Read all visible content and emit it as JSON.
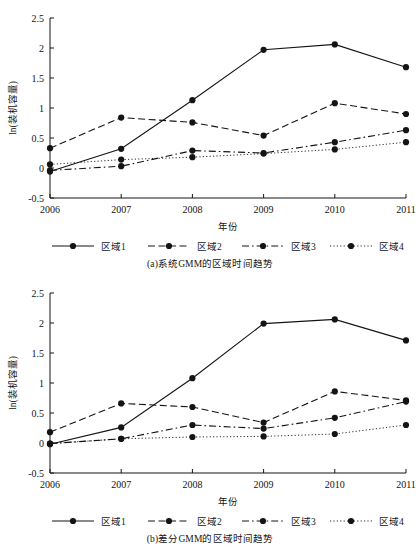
{
  "figure": {
    "panels": [
      {
        "id": "panel-a",
        "caption": "(a)系统GMM的区域时间趋势",
        "chart_data": {
          "type": "line",
          "title": "",
          "xlabel": "年份",
          "ylabel": "ln(装机容量)",
          "categories": [
            "2006",
            "2007",
            "2008",
            "2009",
            "2010",
            "2011"
          ],
          "x": [
            2006,
            2007,
            2008,
            2009,
            2010,
            2011
          ],
          "xlim": [
            2006,
            2011
          ],
          "ylim": [
            -0.5,
            2.5
          ],
          "yticks": [
            -0.5,
            0,
            0.5,
            1,
            1.5,
            2,
            2.5
          ],
          "yticklabels": [
            "-0.5",
            "0",
            "0.5",
            "1",
            "1.5",
            "2",
            "2.5"
          ],
          "grid": false,
          "legend_position": "below-axes",
          "series": [
            {
              "name": "区域1",
              "style": "solid",
              "marker": "filled-circle",
              "values": [
                -0.06,
                0.32,
                1.13,
                1.97,
                2.06,
                1.68
              ]
            },
            {
              "name": "区域2",
              "style": "dashed",
              "marker": "filled-circle",
              "values": [
                0.33,
                0.84,
                0.76,
                0.54,
                1.08,
                0.9
              ]
            },
            {
              "name": "区域3",
              "style": "dashdot",
              "marker": "filled-circle",
              "values": [
                -0.04,
                0.03,
                0.29,
                0.25,
                0.43,
                0.63
              ]
            },
            {
              "name": "区域4",
              "style": "dotted",
              "marker": "filled-circle",
              "values": [
                0.06,
                0.14,
                0.18,
                0.24,
                0.31,
                0.43
              ]
            }
          ]
        }
      },
      {
        "id": "panel-b",
        "caption": "(b)差分GMM的区域时间趋势",
        "chart_data": {
          "type": "line",
          "title": "",
          "xlabel": "年份",
          "ylabel": "ln(装机容量)",
          "categories": [
            "2006",
            "2007",
            "2008",
            "2009",
            "2010",
            "2011"
          ],
          "x": [
            2006,
            2007,
            2008,
            2009,
            2010,
            2011
          ],
          "xlim": [
            2006,
            2011
          ],
          "ylim": [
            -0.5,
            2.5
          ],
          "yticks": [
            -0.5,
            0,
            0.5,
            1,
            1.5,
            2,
            2.5
          ],
          "yticklabels": [
            "-0.5",
            "0",
            "0.5",
            "1",
            "1.5",
            "2",
            "2.5"
          ],
          "grid": false,
          "legend_position": "below-axes",
          "series": [
            {
              "name": "区域1",
              "style": "solid",
              "marker": "filled-circle",
              "values": [
                -0.02,
                0.26,
                1.08,
                1.99,
                2.06,
                1.71
              ]
            },
            {
              "name": "区域2",
              "style": "dashed",
              "marker": "filled-circle",
              "values": [
                0.18,
                0.66,
                0.6,
                0.34,
                0.86,
                0.71
              ]
            },
            {
              "name": "区域3",
              "style": "dashdot",
              "marker": "filled-circle",
              "values": [
                -0.01,
                0.07,
                0.3,
                0.24,
                0.42,
                0.69
              ]
            },
            {
              "name": "区域4",
              "style": "dotted",
              "marker": "filled-circle",
              "values": [
                -0.01,
                0.07,
                0.1,
                0.11,
                0.15,
                0.3
              ]
            }
          ]
        }
      }
    ],
    "colors": {
      "line": "#141414",
      "axis": "#141414",
      "background": "#ffffff"
    }
  }
}
